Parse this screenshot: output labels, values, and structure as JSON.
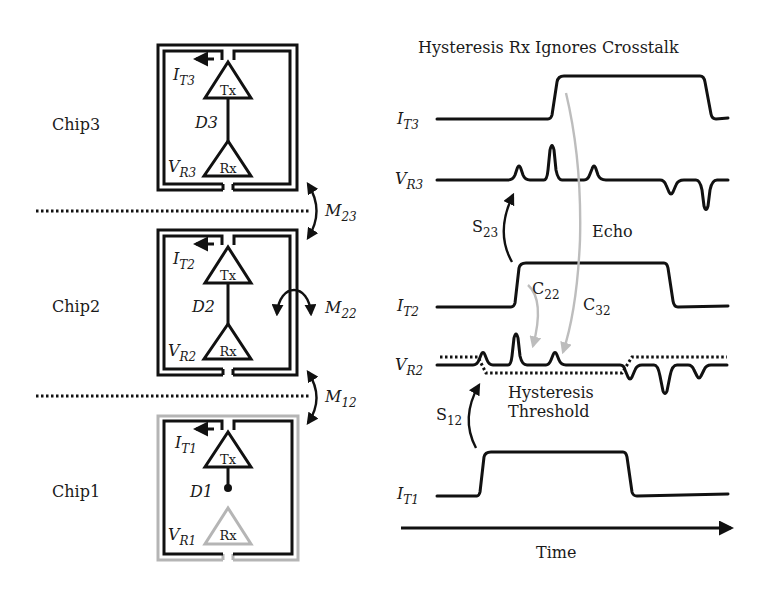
{
  "title": "Hysteresis Rx Ignores Crosstalk",
  "chips": [
    {
      "label": "Chip3",
      "tx": "Tx",
      "rx": "Rx",
      "driver": "D3",
      "current": {
        "main": "I",
        "sub": "T3"
      },
      "voltage": {
        "main": "V",
        "sub": "R3"
      },
      "inductor_color": "#111111",
      "rx_color": "#111111"
    },
    {
      "label": "Chip2",
      "tx": "Tx",
      "rx": "Rx",
      "driver": "D2",
      "current": {
        "main": "I",
        "sub": "T2"
      },
      "voltage": {
        "main": "V",
        "sub": "R2"
      },
      "inductor_color": "#111111",
      "rx_color": "#111111"
    },
    {
      "label": "Chip1",
      "tx": "Tx",
      "rx": "Rx",
      "driver": "D1",
      "current": {
        "main": "I",
        "sub": "T1"
      },
      "voltage": {
        "main": "V",
        "sub": "R1"
      },
      "inductor_color": "#b5b5b5",
      "rx_color": "#b5b5b5"
    }
  ],
  "coupling": [
    {
      "main": "M",
      "sub": "23"
    },
    {
      "main": "M",
      "sub": "22"
    },
    {
      "main": "M",
      "sub": "12"
    }
  ],
  "waveforms": {
    "signals": [
      {
        "main": "I",
        "sub": "T3"
      },
      {
        "main": "V",
        "sub": "R3"
      },
      {
        "main": "I",
        "sub": "T2"
      },
      {
        "main": "V",
        "sub": "R2"
      },
      {
        "main": "I",
        "sub": "T1"
      }
    ],
    "annotations": {
      "s23": {
        "main": "S",
        "sub": "23"
      },
      "s12": {
        "main": "S",
        "sub": "12"
      },
      "c22": {
        "main": "C",
        "sub": "22"
      },
      "c32": {
        "main": "C",
        "sub": "32"
      },
      "echo": "Echo",
      "hysteresis_line1": "Hysteresis",
      "hysteresis_line2": "Threshold"
    },
    "x_axis": "Time"
  },
  "colors": {
    "ink": "#111111",
    "gray_path": "#bdbdbd"
  }
}
